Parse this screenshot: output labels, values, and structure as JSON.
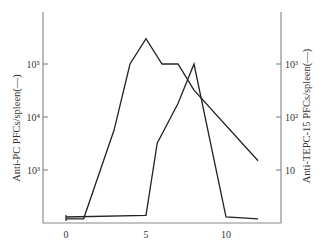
{
  "chart_data": {
    "type": "line",
    "title": "",
    "xlabel": "",
    "x_ticks": [
      "0",
      "5",
      "10"
    ],
    "xlim": [
      0,
      13.5
    ],
    "y_left": {
      "label": "Anti-PC PFCs/spleen(—)",
      "scale": "log",
      "ticks": [
        "10³",
        "10⁴",
        "10⁵"
      ],
      "tick_values": [
        1000,
        10000,
        100000
      ]
    },
    "y_right": {
      "label": "Anti-TEPC-15 PFCs/spleen(—)",
      "scale": "log",
      "ticks": [
        "10",
        "10²",
        "10³"
      ],
      "tick_values": [
        10,
        100,
        1000
      ]
    },
    "grid": false,
    "legend": "none",
    "series": [
      {
        "name": "Anti-PC PFCs/spleen",
        "axis": "left",
        "x": [
          0,
          1.1,
          3,
          4,
          5,
          6,
          7,
          8,
          12
        ],
        "values": [
          120,
          120,
          5600,
          100000,
          300000,
          100000,
          100000,
          32000,
          1500
        ]
      },
      {
        "name": "Anti-TEPC-15 PFCs/spleen",
        "axis": "right",
        "x": [
          0,
          5,
          5.7,
          7,
          8,
          10,
          12
        ],
        "values": [
          1.3,
          1.4,
          32,
          180,
          1000,
          1.3,
          1.2
        ]
      }
    ]
  }
}
